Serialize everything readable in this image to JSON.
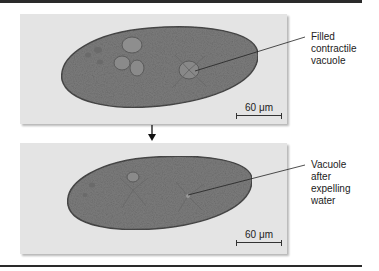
{
  "figure": {
    "panels": [
      {
        "label_lines": [
          "Filled",
          "contractile",
          "vacuole"
        ],
        "scale_bar": "60 μm"
      },
      {
        "label_lines": [
          "Vacuole",
          "after",
          "expelling",
          "water"
        ],
        "scale_bar": "60 μm"
      }
    ],
    "arrow": "down-arrow"
  }
}
